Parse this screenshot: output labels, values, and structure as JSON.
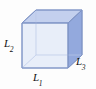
{
  "figure": {
    "type": "3d-rectangular-box-diagram",
    "background_color": "#fdfdfd",
    "labels": {
      "width": {
        "base": "L",
        "sub": "1",
        "position": "bottom-front-edge"
      },
      "height": {
        "base": "L",
        "sub": "2",
        "position": "left-front-edge"
      },
      "depth": {
        "base": "L",
        "sub": "3",
        "position": "right-receding-edge"
      }
    },
    "colors": {
      "front_face": "#e7edf9",
      "top_face": "#c3d0ee",
      "right_face": "#93a9dd",
      "edge_stroke": "#8095c6",
      "hidden_edge_stroke": "#b9c7e6",
      "label_text": "#111111"
    },
    "geometry": {
      "front_face_corners": [
        [
          22,
          23
        ],
        [
          68,
          23
        ],
        [
          68,
          68
        ],
        [
          22,
          68
        ]
      ],
      "depth_offset": [
        14,
        -13
      ],
      "back_face_corners": [
        [
          36,
          10
        ],
        [
          82,
          10
        ],
        [
          82,
          55
        ],
        [
          36,
          55
        ]
      ]
    }
  }
}
